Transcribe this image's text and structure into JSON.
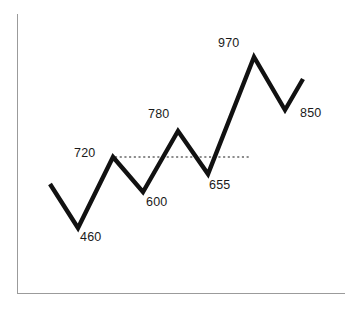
{
  "chart_data": {
    "type": "line",
    "title": "",
    "subtitle": "",
    "xlabel": "",
    "ylabel": "",
    "grid": false,
    "legend": null,
    "axis_style": "left-and-bottom-spines-only",
    "xlim": [
      0,
      10
    ],
    "ylim": [
      380,
      1030
    ],
    "x": [
      1,
      2,
      3,
      4,
      5,
      6,
      7,
      8,
      9
    ],
    "values": [
      620,
      460,
      720,
      600,
      780,
      655,
      970,
      790,
      850
    ],
    "labels": [
      "",
      "460",
      "720",
      "600",
      "780",
      "655",
      "970",
      "",
      "850"
    ],
    "series": [
      {
        "name": "value",
        "values": [
          620,
          460,
          720,
          600,
          780,
          655,
          970,
          790,
          850
        ]
      }
    ],
    "annotations": [
      {
        "id": "p460",
        "text": "460",
        "value": 460,
        "position": "below"
      },
      {
        "id": "p720",
        "text": "720",
        "value": 720,
        "position": "left"
      },
      {
        "id": "p600",
        "text": "600",
        "value": 600,
        "position": "below"
      },
      {
        "id": "p780",
        "text": "780",
        "value": 780,
        "position": "above"
      },
      {
        "id": "p655",
        "text": "655",
        "value": 655,
        "position": "below-right"
      },
      {
        "id": "p970",
        "text": "970",
        "value": 970,
        "position": "above-left"
      },
      {
        "id": "p850",
        "text": "850",
        "value": 850,
        "position": "right"
      }
    ],
    "reference_line": {
      "value": 720,
      "label": "720",
      "style": "dotted",
      "x_start": 3,
      "x_end": 6.4
    },
    "colors": {
      "series": "#111111",
      "axis": "#9b9b9b",
      "reference": "#1a1a1a",
      "label_text": "#1a1a1a",
      "background": "#ffffff"
    }
  },
  "geometry": {
    "series_path": "M 50,184 L 78,228 L 113,157 L 143,192 L 178,131 L 208,174 L 254,57 L 285,110 L 303,79",
    "reference_path": "M 115,157 L 250,157",
    "y_axis_path": "M 17.5,14 L 17.5,294",
    "x_axis_path": "M 17.5,293.5 L 345,293.5"
  },
  "labels": {
    "p460": {
      "text": "460",
      "left": 80,
      "top": 231
    },
    "p720": {
      "text": "720",
      "left": 74,
      "top": 147
    },
    "p600": {
      "text": "600",
      "left": 146,
      "top": 196
    },
    "p780": {
      "text": "780",
      "left": 148,
      "top": 108
    },
    "p655": {
      "text": "655",
      "left": 209,
      "top": 179
    },
    "p970": {
      "text": "970",
      "left": 218,
      "top": 37
    },
    "p850": {
      "text": "850",
      "left": 300,
      "top": 107
    }
  }
}
